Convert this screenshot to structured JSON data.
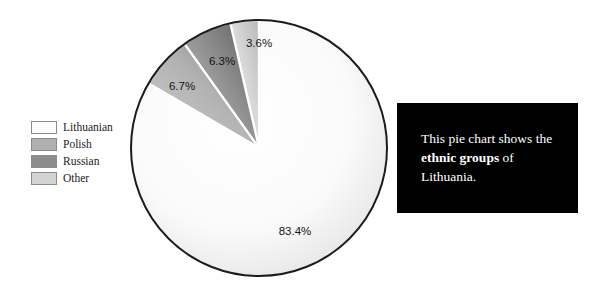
{
  "chart_data": {
    "type": "pie",
    "title": "",
    "categories": [
      "Lithuanian",
      "Polish",
      "Russian",
      "Other"
    ],
    "values": [
      83.4,
      6.7,
      6.3,
      3.6
    ],
    "value_labels": [
      "83.4%",
      "6.7%",
      "6.3%",
      "3.6%"
    ],
    "unit": "%",
    "start_angle_deg": 90,
    "direction": "counterclockwise",
    "legend_position": "left",
    "grid": false,
    "slice_colors": [
      "#f7f7f7",
      "#b4b4b4",
      "#8e8e8e",
      "#d6d6d6"
    ],
    "outline_color": "#1b1b1b",
    "separator_color": "#ffffff"
  },
  "legend": {
    "items": [
      {
        "label": "Lithuanian",
        "color": "#fbfbfb"
      },
      {
        "label": "Polish",
        "color": "#b0b0b0"
      },
      {
        "label": "Russian",
        "color": "#8c8c8c"
      },
      {
        "label": "Other",
        "color": "#d2d2d2"
      }
    ]
  },
  "slice_labels": {
    "lithuanian": "83.4%",
    "polish": "6.7%",
    "russian": "6.3%",
    "other": "3.6%"
  },
  "caption": {
    "line1": "This pie chart shows",
    "line2_prefix": "the ",
    "line2_bold": "ethnic groups",
    "line2_suffix": " of",
    "line3": "Lithuania.",
    "background_color": "#000000",
    "text_color": "#ffffff"
  }
}
